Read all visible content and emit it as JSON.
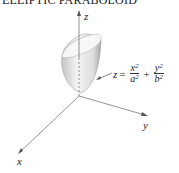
{
  "title": "ELLIPTIC PARABOLOID",
  "axes": {
    "x": "x",
    "y": "y",
    "z": "z"
  },
  "equation": {
    "lhs": "z",
    "eq": "=",
    "term1": {
      "num": "x",
      "num_exp": "2",
      "den": "a",
      "den_exp": "2"
    },
    "plus": "+",
    "term2": {
      "num": "y",
      "num_exp": "2",
      "den": "b",
      "den_exp": "2"
    }
  },
  "colors": {
    "axis": "#777777",
    "surface_light": "#f2f2f2",
    "surface_dark": "#bdbdbd"
  }
}
